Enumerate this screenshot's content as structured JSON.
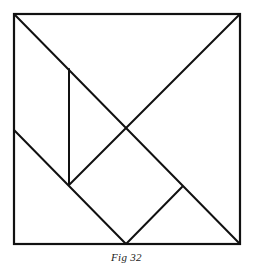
{
  "figure": {
    "caption": "Fig 32",
    "stroke_color": "#111111",
    "stroke_width": 2,
    "outer_square": {
      "x1": 14,
      "y1": 14,
      "x2": 240,
      "y2": 244
    },
    "segments": [
      {
        "name": "main-diagonal",
        "x1": 14,
        "y1": 14,
        "x2": 240,
        "y2": 244
      },
      {
        "name": "anti-diagonal-upper",
        "x1": 240,
        "y1": 14,
        "x2": 69,
        "y2": 185
      },
      {
        "name": "vertical-edge",
        "x1": 69,
        "y1": 69,
        "x2": 69,
        "y2": 185
      },
      {
        "name": "lower-left-diagonal",
        "x1": 14,
        "y1": 130,
        "x2": 126,
        "y2": 244
      },
      {
        "name": "lower-right-short",
        "x1": 126,
        "y1": 244,
        "x2": 182,
        "y2": 187
      }
    ]
  }
}
